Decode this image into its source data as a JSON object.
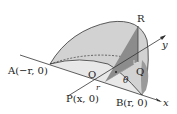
{
  "labels": {
    "A": "A(−r, 0)",
    "O": "O",
    "P": "P(x, 0)",
    "B": "B(r, 0)",
    "Q": "Q",
    "R": "R",
    "x_axis": "x",
    "y_axis": "y",
    "theta": "θ",
    "r": "r"
  },
  "colors": {
    "surface": "#d4d4d4",
    "triangle_dark": "#8a8a8a",
    "triangle_mid": "#a8a8a8",
    "base": "#e6e6e6",
    "stroke": "#333333"
  }
}
